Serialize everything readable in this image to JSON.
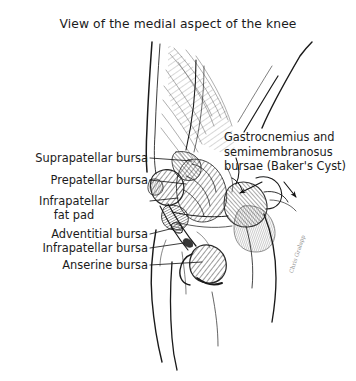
{
  "figure": {
    "title": "View of the medial aspect of the knee",
    "media": "pen-and-ink anatomical line drawing",
    "background_color": "#ffffff",
    "ink_color": "#1a1a1a",
    "signature": "Chris Gralapp"
  },
  "labels_left": [
    {
      "text": "Suprapatellar bursa",
      "y": 152,
      "leader": true
    },
    {
      "text": "Prepatellar bursa",
      "y": 174,
      "leader": true
    },
    {
      "text": "Infrapatellar",
      "y": 195,
      "leader": true
    },
    {
      "text": "fat pad",
      "y": 209,
      "leader": false
    },
    {
      "text": "Adventitial bursa",
      "y": 228,
      "leader": true
    },
    {
      "text": "Infrapatellar bursa",
      "y": 242,
      "leader": true
    },
    {
      "text": "Anserine bursa",
      "y": 259,
      "leader": true
    }
  ],
  "label_right": {
    "lines": [
      "Gastrocnemius and",
      "semimembranosus",
      "bursae (Baker's Cyst)"
    ]
  }
}
